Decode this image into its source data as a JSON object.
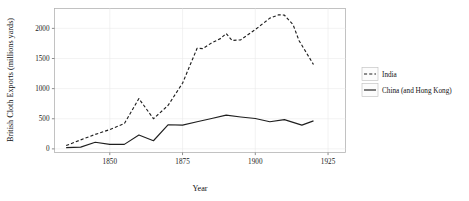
{
  "chart_data": {
    "type": "line",
    "title": "",
    "xlabel": "Year",
    "ylabel": "British Cloth Exports (millions yards)",
    "xlim": [
      1831,
      1931
    ],
    "ylim": [
      -60,
      2330
    ],
    "xticks": [
      1850,
      1875,
      1900,
      1925
    ],
    "xtick_labels": [
      "1850",
      "1875",
      "1900",
      "1925"
    ],
    "yticks": [
      0,
      500,
      1000,
      1500,
      2000
    ],
    "ytick_labels": [
      "0",
      "500",
      "1000",
      "1500",
      "2000"
    ],
    "grid": true,
    "legend_position": "right",
    "series": [
      {
        "name": "India",
        "style": "dashed",
        "color": "#1f1f1f",
        "x": [
          1835,
          1840,
          1845,
          1850,
          1855,
          1860,
          1865,
          1870,
          1875,
          1880,
          1882,
          1885,
          1888,
          1890,
          1892,
          1895,
          1900,
          1905,
          1908,
          1910,
          1913,
          1915,
          1920
        ],
        "y": [
          55,
          150,
          240,
          320,
          420,
          835,
          500,
          720,
          1090,
          1670,
          1665,
          1760,
          1830,
          1915,
          1800,
          1810,
          1980,
          2170,
          2225,
          2220,
          2060,
          1800,
          1400
        ]
      },
      {
        "name": "China (and Hong Kong)",
        "style": "solid",
        "color": "#1f1f1f",
        "x": [
          1835,
          1840,
          1845,
          1850,
          1855,
          1860,
          1865,
          1870,
          1875,
          1880,
          1885,
          1890,
          1895,
          1900,
          1905,
          1910,
          1913,
          1916,
          1920
        ],
        "y": [
          20,
          30,
          110,
          75,
          75,
          230,
          135,
          400,
          395,
          450,
          505,
          560,
          530,
          505,
          450,
          485,
          440,
          395,
          465
        ]
      }
    ],
    "legend_entries": [
      {
        "label": "India",
        "style": "dashed"
      },
      {
        "label": "China (and Hong Kong)",
        "style": "solid"
      }
    ]
  }
}
